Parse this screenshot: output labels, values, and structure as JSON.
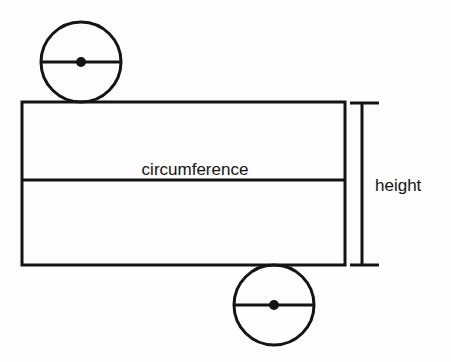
{
  "figure": {
    "title_visible": false,
    "background_color": "#fdfdfd",
    "ink_color": "#141414",
    "labels": {
      "circumference": "circumference",
      "height": "height"
    },
    "shapes": {
      "rectangle": {
        "name": "lateral-surface-rectangle",
        "x": 22,
        "y": 102,
        "width": 323,
        "height": 163,
        "stroke_width": 3
      },
      "divider_line": {
        "name": "rectangle-divider-line",
        "x1": 22,
        "y1": 180,
        "x2": 345,
        "y2": 180,
        "stroke_width": 3
      },
      "top_circle": {
        "name": "top-base-circle",
        "cx": 81,
        "cy": 62,
        "r": 40,
        "stroke_width": 3,
        "diameter_line": {
          "x1": 41,
          "y1": 62,
          "x2": 121,
          "y2": 62,
          "stroke_width": 3
        },
        "center_dot_r": 5
      },
      "bottom_circle": {
        "name": "bottom-base-circle",
        "cx": 274,
        "cy": 305,
        "r": 40,
        "stroke_width": 3,
        "diameter_line": {
          "x1": 234,
          "y1": 305,
          "x2": 314,
          "y2": 305,
          "stroke_width": 3
        },
        "center_dot_r": 5
      },
      "height_dimension": {
        "name": "height-dimension-line",
        "x": 362,
        "y_top": 103,
        "y_bottom": 265,
        "tick_left": 350,
        "tick_right": 379,
        "stroke_width": 3
      }
    },
    "label_positions": {
      "circumference": {
        "x": 195,
        "y": 175,
        "anchor": "middle",
        "font_size": 17
      },
      "height": {
        "x": 375,
        "y": 191,
        "anchor": "start",
        "font_size": 17
      }
    }
  }
}
